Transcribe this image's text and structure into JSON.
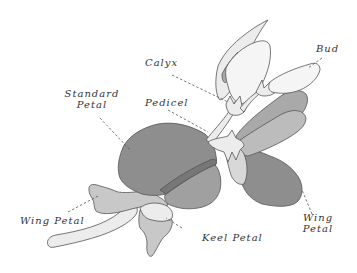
{
  "diagram": {
    "labels": {
      "calyx": "Calyx",
      "bud": "Bud",
      "standard_petal_line1": "Standard",
      "standard_petal_line2": "Petal",
      "pedicel": "Pedicel",
      "wing_petal_left": "Wing Petal",
      "keel_petal": "Keel Petal",
      "wing_petal_right_line1": "Wing",
      "wing_petal_right_line2": "Petal"
    },
    "colors": {
      "dark_petal": "#8e8e8e",
      "mid_petal": "#a9a9a9",
      "light_petal": "#c8c8c8",
      "pale_petal": "#ececec",
      "outline": "#555555",
      "background": "#ffffff"
    }
  }
}
